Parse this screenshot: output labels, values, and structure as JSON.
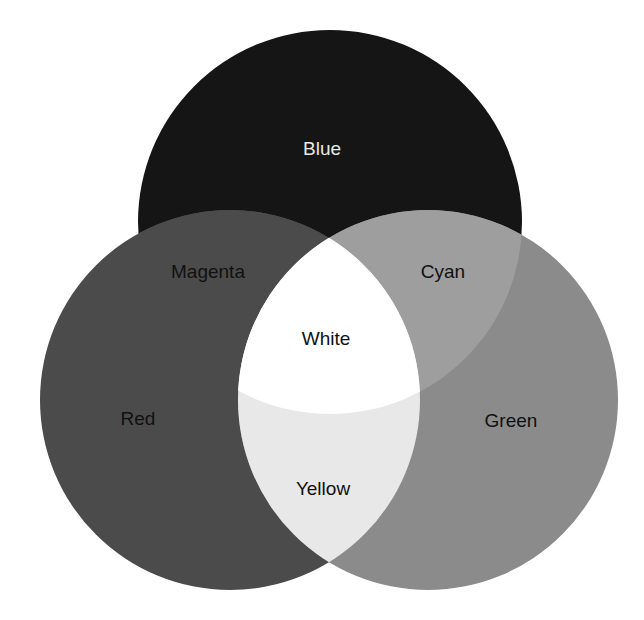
{
  "diagram": {
    "type": "additive-color-venn",
    "circles": [
      {
        "id": "blue",
        "label": "Blue",
        "cx": 330,
        "cy": 222,
        "r": 192,
        "fill": "#151515",
        "label_color": "#e8e8e8",
        "label_x": 322,
        "label_y": 155
      },
      {
        "id": "red",
        "label": "Red",
        "cx": 230,
        "cy": 400,
        "r": 190,
        "fill": "#4b4b4b",
        "label_color": "#111111",
        "label_x": 138,
        "label_y": 425
      },
      {
        "id": "green",
        "label": "Green",
        "cx": 428,
        "cy": 400,
        "r": 190,
        "fill": "#8b8b8b",
        "label_color": "#111111",
        "label_x": 511,
        "label_y": 427
      }
    ],
    "overlaps": [
      {
        "id": "magenta",
        "label": "Magenta",
        "of": [
          "red",
          "blue"
        ],
        "fill": "#4b4b4b",
        "label_color": "#111111",
        "label_x": 208,
        "label_y": 278
      },
      {
        "id": "cyan",
        "label": "Cyan",
        "of": [
          "green",
          "blue"
        ],
        "fill": "#9e9e9e",
        "label_color": "#111111",
        "label_x": 443,
        "label_y": 278
      },
      {
        "id": "yellow",
        "label": "Yellow",
        "of": [
          "red",
          "green"
        ],
        "fill": "#e8e8e8",
        "label_color": "#111111",
        "label_x": 323,
        "label_y": 495
      },
      {
        "id": "white",
        "label": "White",
        "of": [
          "red",
          "green",
          "blue"
        ],
        "fill": "#ffffff",
        "label_color": "#111111",
        "label_x": 326,
        "label_y": 345
      }
    ],
    "background": "#ffffff"
  }
}
